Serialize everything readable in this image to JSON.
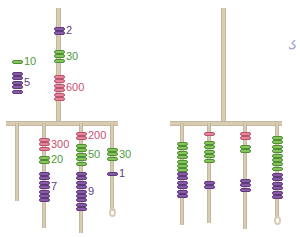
{
  "colors": {
    "purple": "#8a5aa8",
    "green": "#86c45e",
    "pink": "#e8839a",
    "rope": "#d8cdb4"
  },
  "left_mobile": {
    "top_string": [
      {
        "color": "purple",
        "beads": 2,
        "label": "2"
      },
      {
        "color": "green",
        "beads": 3,
        "label": "30"
      },
      {
        "color": "pink",
        "beads": 6,
        "label": "600"
      }
    ],
    "strings": [
      {
        "groups": [
          {
            "color": "green",
            "beads": 1,
            "label": "10"
          },
          {
            "color": "purple",
            "beads": 5,
            "label": "5"
          }
        ]
      },
      {
        "groups": [
          {
            "color": "pink",
            "beads": 3,
            "label": "300"
          },
          {
            "color": "green",
            "beads": 2,
            "label": "20"
          },
          {
            "color": "purple",
            "beads": 7,
            "label": "7"
          }
        ]
      },
      {
        "groups": [
          {
            "color": "pink",
            "beads": 2,
            "label": "200"
          },
          {
            "color": "green",
            "beads": 5,
            "label": "50"
          },
          {
            "color": "purple",
            "beads": 9,
            "label": "9"
          }
        ]
      },
      {
        "groups": [
          {
            "color": "green",
            "beads": 3,
            "label": "30"
          },
          {
            "color": "purple",
            "beads": 1,
            "label": "1"
          }
        ],
        "loop": true
      }
    ]
  },
  "right_mobile": {
    "strings": [
      {
        "groups": [
          {
            "color": "green",
            "beads": 7
          },
          {
            "color": "purple",
            "beads": 6
          }
        ]
      },
      {
        "groups": [
          {
            "color": "pink",
            "beads": 1
          },
          {
            "color": "green",
            "beads": 5
          },
          {
            "color": "purple",
            "beads": 2
          }
        ]
      },
      {
        "groups": [
          {
            "color": "pink",
            "beads": 2
          },
          {
            "color": "green",
            "beads": 2
          },
          {
            "color": "purple",
            "beads": 3
          }
        ]
      },
      {
        "groups": [
          {
            "color": "green",
            "beads": 8
          },
          {
            "color": "purple",
            "beads": 6
          }
        ],
        "loop": true
      }
    ]
  },
  "margin_mark": "ک"
}
